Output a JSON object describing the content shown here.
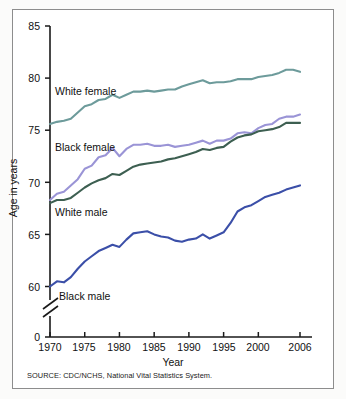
{
  "chart_data": {
    "type": "line",
    "title": "",
    "xlabel": "Year",
    "ylabel": "Age in years",
    "xlim": [
      1970,
      2006
    ],
    "ylim": [
      58.5,
      85
    ],
    "grid": false,
    "legend_position": "inline-annotations",
    "axis_break": true,
    "axis_break_note": "y-axis broken between 0 and ~59",
    "xticks": [
      "1970",
      "1975",
      "1980",
      "1985",
      "1990",
      "1995",
      "2000",
      "2006"
    ],
    "xtick_values": [
      1970,
      1975,
      1980,
      1985,
      1990,
      1995,
      2000,
      2006
    ],
    "yticks": [
      "0",
      "60",
      "65",
      "70",
      "75",
      "80",
      "85"
    ],
    "ytick_values": [
      0,
      60,
      65,
      70,
      75,
      80,
      85
    ],
    "x": [
      1970,
      1971,
      1972,
      1973,
      1974,
      1975,
      1976,
      1977,
      1978,
      1979,
      1980,
      1981,
      1982,
      1983,
      1984,
      1985,
      1986,
      1987,
      1988,
      1989,
      1990,
      1991,
      1992,
      1993,
      1994,
      1995,
      1996,
      1997,
      1998,
      1999,
      2000,
      2001,
      2002,
      2003,
      2004,
      2005,
      2006
    ],
    "series": [
      {
        "name": "White female",
        "color": "#6d9b9b",
        "values": [
          75.6,
          75.8,
          75.9,
          76.1,
          76.7,
          77.3,
          77.5,
          77.9,
          78.0,
          78.4,
          78.1,
          78.4,
          78.7,
          78.7,
          78.8,
          78.7,
          78.8,
          78.9,
          78.9,
          79.2,
          79.4,
          79.6,
          79.8,
          79.5,
          79.6,
          79.6,
          79.7,
          79.9,
          79.9,
          79.9,
          80.1,
          80.2,
          80.3,
          80.5,
          80.8,
          80.8,
          80.6
        ]
      },
      {
        "name": "Black female",
        "color": "#9a94d6",
        "values": [
          68.3,
          68.9,
          69.1,
          69.7,
          70.3,
          71.3,
          71.6,
          72.4,
          72.6,
          73.3,
          72.5,
          73.2,
          73.6,
          73.6,
          73.7,
          73.5,
          73.5,
          73.6,
          73.4,
          73.5,
          73.6,
          73.8,
          74.0,
          73.7,
          74.0,
          74.0,
          74.2,
          74.7,
          74.8,
          74.7,
          75.2,
          75.5,
          75.6,
          76.1,
          76.3,
          76.3,
          76.5
        ]
      },
      {
        "name": "White male",
        "color": "#3d5f51",
        "values": [
          68.0,
          68.3,
          68.3,
          68.5,
          69.0,
          69.5,
          69.9,
          70.2,
          70.4,
          70.8,
          70.7,
          71.1,
          71.5,
          71.7,
          71.8,
          71.9,
          72.0,
          72.2,
          72.3,
          72.5,
          72.7,
          72.9,
          73.2,
          73.1,
          73.3,
          73.4,
          73.9,
          74.3,
          74.5,
          74.6,
          74.9,
          75.0,
          75.1,
          75.3,
          75.7,
          75.7,
          75.7
        ]
      },
      {
        "name": "Black male",
        "color": "#3b4fa8",
        "values": [
          60.0,
          60.5,
          60.4,
          60.9,
          61.7,
          62.4,
          62.9,
          63.4,
          63.7,
          64.0,
          63.8,
          64.5,
          65.1,
          65.2,
          65.3,
          65.0,
          64.8,
          64.7,
          64.4,
          64.3,
          64.5,
          64.6,
          65.0,
          64.6,
          64.9,
          65.2,
          66.1,
          67.2,
          67.6,
          67.8,
          68.2,
          68.6,
          68.8,
          69.0,
          69.3,
          69.5,
          69.7
        ]
      }
    ]
  },
  "annotations": {
    "white_female_label": "White female",
    "black_female_label": "Black female",
    "white_male_label": "White male",
    "black_male_label": "Black male"
  },
  "axes": {
    "x_title": "Year",
    "y_title": "Age in years"
  },
  "footer": {
    "source": "SOURCE: CDC/NCHS, National Vital Statistics System."
  }
}
